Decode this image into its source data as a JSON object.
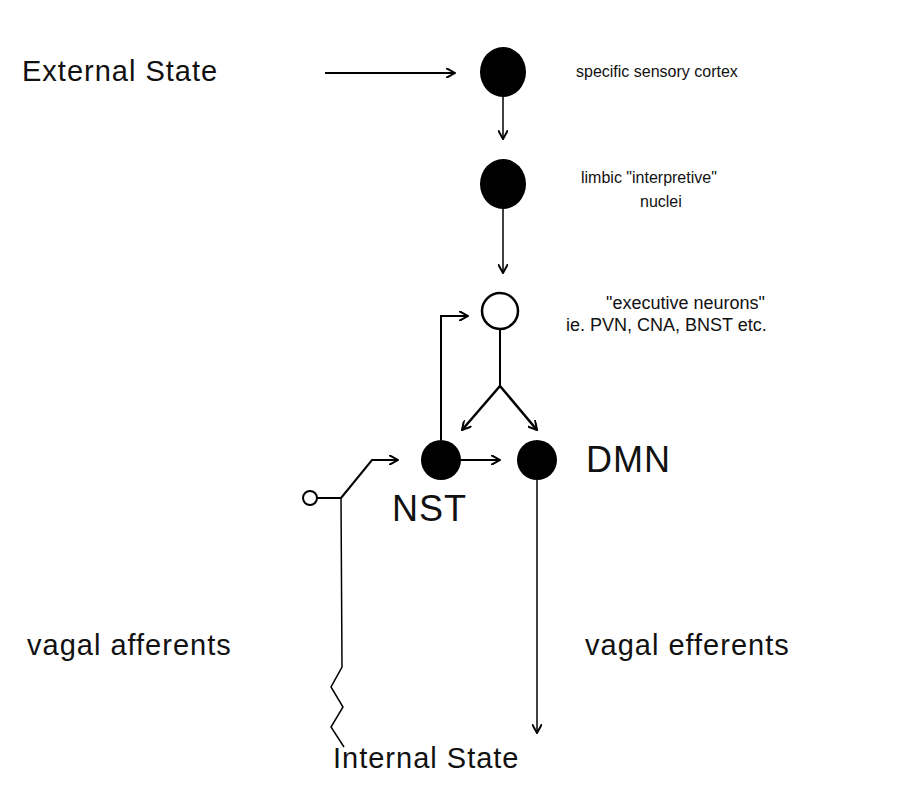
{
  "diagram": {
    "labels": {
      "external_state": "External State",
      "internal_state": "Internal State",
      "sensory_cortex": "specific sensory cortex",
      "limbic_line1": "limbic \"interpretive\"",
      "limbic_line2": "nuclei",
      "executive_line1": "\"executive neurons\"",
      "executive_line2": "ie. PVN, CNA, BNST etc.",
      "nst": "NST",
      "dmn": "DMN",
      "vagal_afferents": "vagal afferents",
      "vagal_efferents": "vagal efferents"
    },
    "nodes": [
      {
        "id": "sensory-cortex",
        "fill": "black"
      },
      {
        "id": "limbic-nuclei",
        "fill": "black"
      },
      {
        "id": "executive-neurons",
        "fill": "white"
      },
      {
        "id": "nst",
        "fill": "black"
      },
      {
        "id": "dmn",
        "fill": "black"
      }
    ],
    "colors": {
      "ink": "#000000",
      "background": "#ffffff"
    }
  }
}
